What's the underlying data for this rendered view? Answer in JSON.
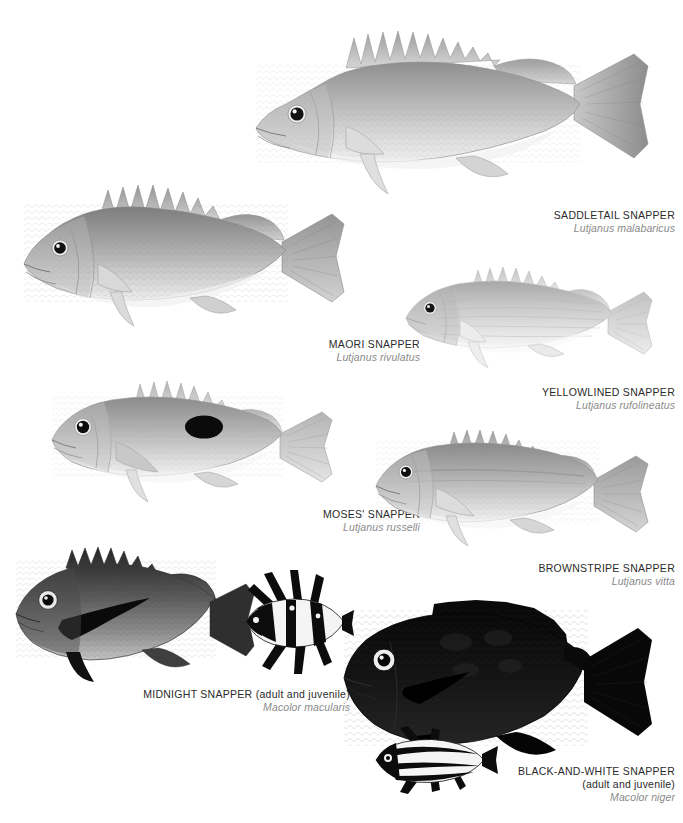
{
  "plate": {
    "background": "#ffffff",
    "name_color": "#2b2b2b",
    "sci_color": "#8a8a8a"
  },
  "species": [
    {
      "id": "saddletail-snapper",
      "common_name": "SADDLETAIL SNAPPER",
      "scientific_name": "Lutjanus malabaricus",
      "qualifier": "",
      "body_tone": "#b9b9b9",
      "fin_tone": "#c9c9c9"
    },
    {
      "id": "maori-snapper",
      "common_name": "MAORI SNAPPER",
      "scientific_name": "Lutjanus rivulatus",
      "qualifier": "",
      "body_tone": "#a9a9a9",
      "fin_tone": "#bdbdbd"
    },
    {
      "id": "yellowlined-snapper",
      "common_name": "YELLOWLINED SNAPPER",
      "scientific_name": "Lutjanus rufolineatus",
      "qualifier": "",
      "body_tone": "#cfcfcf",
      "fin_tone": "#dcdcdc"
    },
    {
      "id": "moses-snapper",
      "common_name": "MOSES' SNAPPER",
      "scientific_name": "Lutjanus russelli",
      "qualifier": "",
      "body_tone": "#b4b4b4",
      "fin_tone": "#c6c6c6",
      "marking": "black oval flank spot"
    },
    {
      "id": "brownstripe-snapper",
      "common_name": "BROWNSTRIPE SNAPPER",
      "scientific_name": "Lutjanus vitta",
      "qualifier": "",
      "body_tone": "#b0b0b0",
      "fin_tone": "#c2c2c2"
    },
    {
      "id": "midnight-snapper",
      "common_name": "MIDNIGHT SNAPPER (adult and juvenile)",
      "scientific_name": "Macolor macularis",
      "qualifier": "",
      "body_tone": "#5a5a5a",
      "fin_tone": "#3c3c3c"
    },
    {
      "id": "black-and-white-snapper",
      "common_name": "BLACK-AND-WHITE SNAPPER",
      "qualifier": "(adult and juvenile)",
      "scientific_name": "Macolor niger",
      "body_tone": "#141414",
      "fin_tone": "#0c0c0c"
    }
  ]
}
